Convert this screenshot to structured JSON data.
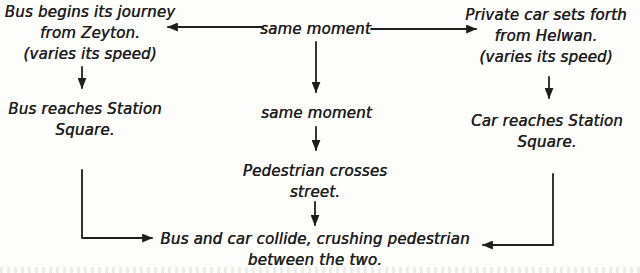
{
  "colors": {
    "ink": "#1e1e1e",
    "background": "#fdfdfc"
  },
  "nodes": {
    "bus_start": {
      "lines": [
        "Bus begins its journey",
        "from Zeyton.",
        "(varies its speed)"
      ]
    },
    "same_moment_top": {
      "lines": [
        "same moment"
      ]
    },
    "car_start": {
      "lines": [
        "Private car sets forth",
        "from Helwan.",
        "(varies its speed)"
      ]
    },
    "bus_reach": {
      "lines": [
        "Bus reaches Station",
        "Square."
      ]
    },
    "same_moment_mid": {
      "lines": [
        "same moment"
      ]
    },
    "car_reach": {
      "lines": [
        "Car reaches Station",
        "Square."
      ]
    },
    "pedestrian_cross": {
      "lines": [
        "Pedestrian crosses",
        "street."
      ]
    },
    "collision": {
      "lines": [
        "Bus and car collide, crushing pedestrian",
        "between the two."
      ]
    }
  }
}
